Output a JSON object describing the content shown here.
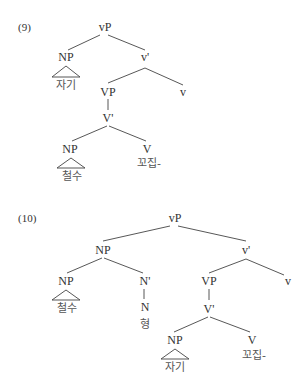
{
  "examples": [
    {
      "number": "(9)",
      "nodes": {
        "root": "vP",
        "spec": "NP",
        "spec_word": "자기",
        "vbar": "v'",
        "vp": "VP",
        "v_head": "v",
        "Vbar": "V'",
        "obj": "NP",
        "obj_word": "철수",
        "V": "V",
        "verb": "꼬집-"
      }
    },
    {
      "number": "(10)",
      "nodes": {
        "root": "vP",
        "spec": "NP",
        "poss": "NP",
        "poss_word": "철수",
        "nbar": "N'",
        "n": "N",
        "n_word": "형",
        "vbar": "v'",
        "vp": "VP",
        "v_head": "v",
        "Vbar": "V'",
        "obj": "NP",
        "obj_word": "자기",
        "V": "V",
        "verb": "꼬집-"
      }
    }
  ]
}
